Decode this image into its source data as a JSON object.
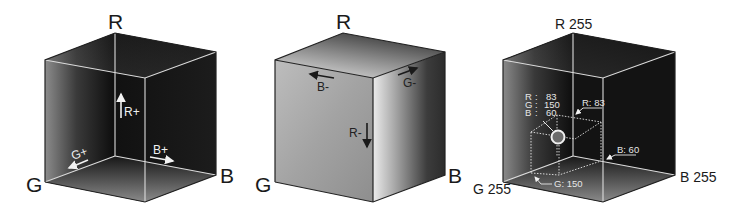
{
  "figure": {
    "cubes": [
      {
        "id": "rgb-cube-outside-view",
        "corner_labels": {
          "r": "R",
          "g": "G",
          "b": "B"
        },
        "arrow_labels": {
          "r": "R+",
          "g": "G+",
          "b": "B+"
        }
      },
      {
        "id": "rgb-cube-surface-view",
        "corner_labels": {
          "r": "R",
          "g": "G",
          "b": "B"
        },
        "arrow_labels": {
          "r": "R-",
          "g": "G-",
          "b": "B-"
        }
      },
      {
        "id": "rgb-cube-point-example",
        "corner_labels": {
          "r": "R 255",
          "g": "G 255",
          "b": "B 255"
        },
        "point": {
          "readout": [
            {
              "channel": "R",
              "sep": ":",
              "value": "83"
            },
            {
              "channel": "G",
              "sep": ":",
              "value": "150"
            },
            {
              "channel": "B",
              "sep": ":",
              "value": "60"
            }
          ],
          "callouts": {
            "r": "R: 83",
            "g": "G: 150",
            "b": "B: 60"
          }
        }
      }
    ]
  }
}
